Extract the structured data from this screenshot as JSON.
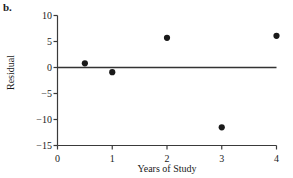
{
  "panel": {
    "label": "b."
  },
  "chart_data": {
    "type": "scatter",
    "title": "",
    "xlabel": "Years of Study",
    "ylabel": "Residual",
    "xlim": [
      0,
      4
    ],
    "ylim": [
      -15,
      10
    ],
    "xticks": [
      0,
      1,
      2,
      3,
      4
    ],
    "xtick_labels": [
      "0",
      "1",
      "2",
      "3",
      "4"
    ],
    "yticks": [
      10,
      5,
      0,
      -5,
      -10,
      -15
    ],
    "ytick_labels": [
      "10",
      "5",
      "0",
      "−5",
      "−10",
      "−15"
    ],
    "grid": false,
    "legend": null,
    "reference_line": {
      "orientation": "horizontal",
      "y": 0,
      "color": "#333333"
    },
    "x": [
      0.5,
      1.0,
      2.0,
      3.0,
      4.0
    ],
    "y": [
      0.8,
      -0.9,
      5.7,
      -11.5,
      6.1
    ],
    "marker": {
      "shape": "circle",
      "color": "#1a1a1a",
      "size": 5
    },
    "points": [
      {
        "x": 0.5,
        "y": 0.8
      },
      {
        "x": 1.0,
        "y": -0.9
      },
      {
        "x": 2.0,
        "y": 5.7
      },
      {
        "x": 3.0,
        "y": -11.5
      },
      {
        "x": 4.0,
        "y": 6.1
      }
    ]
  },
  "axis_style": {
    "line_color": "#3a3a3a",
    "tick_length": 4
  }
}
